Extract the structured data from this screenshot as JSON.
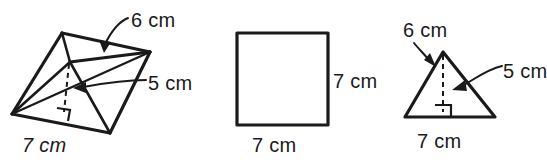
{
  "figure": {
    "units": "cm",
    "ink_color": "#1a1a1a",
    "background_color": "#ffffff"
  },
  "figures": [
    {
      "id": "prism",
      "name": "triangular-prism",
      "labels": {
        "slant": "6 cm",
        "height": "5 cm",
        "base": "7 cm"
      }
    },
    {
      "id": "square",
      "name": "square",
      "labels": {
        "side_right": "7 cm",
        "side_bottom": "7 cm"
      }
    },
    {
      "id": "triangle",
      "name": "triangle",
      "labels": {
        "slant": "6 cm",
        "height": "5 cm",
        "base": "7 cm"
      }
    }
  ]
}
